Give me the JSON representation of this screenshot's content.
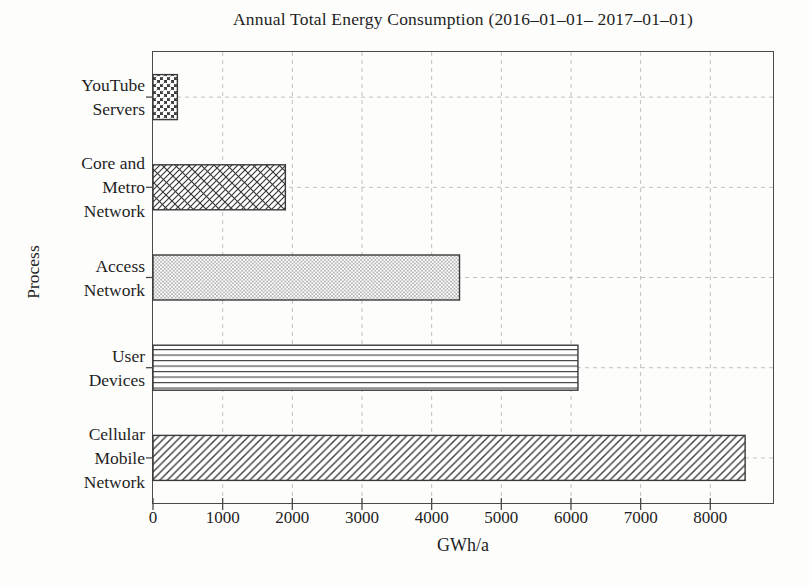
{
  "canvas": {
    "background": "#fdfdfc",
    "ink_color": "#262626",
    "axis_color": "#4a4a4a",
    "grid_color": "#c0c0c0",
    "hatch_color": "#383838",
    "bar_fill": "#ffffff"
  },
  "chart_data": {
    "type": "bar",
    "orientation": "horizontal",
    "title": "Annual Total Energy Consumption (2016–01–01– 2017–01–01)",
    "xlabel": "GWh/a",
    "ylabel": "Process",
    "categories": [
      "YouTube Servers",
      "Core and Metro Network",
      "Access Network",
      "User Devices",
      "Cellular Mobile Network"
    ],
    "category_label_lines": [
      [
        "YouTube",
        "Servers"
      ],
      [
        "Core and",
        "Metro",
        "Network"
      ],
      [
        "Access",
        "Network"
      ],
      [
        "User",
        "Devices"
      ],
      [
        "Cellular",
        "Mobile",
        "Network"
      ]
    ],
    "values": [
      350,
      1900,
      4400,
      6100,
      8500
    ],
    "hatches": [
      "circles",
      "diagonal-crosshatch",
      "dots",
      "horizontal-lines",
      "diagonal-lines"
    ],
    "xlim": [
      0,
      8900
    ],
    "xticks": [
      0,
      1000,
      2000,
      3000,
      4000,
      5000,
      6000,
      7000,
      8000
    ],
    "grid": true,
    "grid_style": "dashed",
    "legend": false
  }
}
